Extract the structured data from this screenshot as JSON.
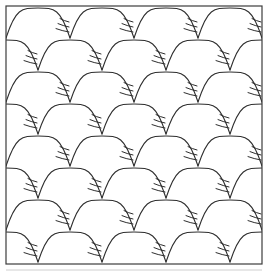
{
  "figure": {
    "title": "Clamshell quilting pattern swatch",
    "type": "ornamental-pattern",
    "background_color": "#ffffff",
    "canvas": {
      "width": 268,
      "height": 273
    }
  },
  "frame": {
    "name": "square-border",
    "x": 6,
    "y": 6,
    "width": 256,
    "height": 258,
    "stroke_color": "#3c3c3c",
    "stroke_width": 1.2,
    "fill": "none"
  },
  "baseline": {
    "name": "faint-lower-rule",
    "x1": 6,
    "x2": 262,
    "y": 270,
    "stroke_color": "#cfcfcf",
    "stroke_width": 1
  },
  "pattern": {
    "name": "clamshell-scale-tessellation",
    "motif": "scallop-arc-with-feather-ticks",
    "arc_stroke_color": "#2e2e2e",
    "arc_stroke_width": 1.1,
    "feather_stroke_color": "#2e2e2e",
    "feather_stroke_width": 1.0,
    "columns_per_row": 4,
    "rows": 8,
    "column_period": 64,
    "row_spacing": 32,
    "arc_radius": 32,
    "arc_rise": 30,
    "offset_rows_shift": 32,
    "row_offsets": [
      0,
      32,
      0,
      32,
      0,
      32,
      0,
      32
    ],
    "row_baseline_y": [
      38,
      70,
      102,
      134,
      166,
      198,
      230,
      262
    ],
    "feather_ticks_per_cusp": 3,
    "feather_tick_lengths": [
      13,
      11,
      9
    ],
    "feather_tick_spacing": 5,
    "feather_side": "left-of-cusp",
    "clip_to_frame": true
  },
  "chart_data": {
    "type": "pattern",
    "title": "Clamshell quilting pattern swatch",
    "xlabel": "",
    "ylabel": "",
    "categories": [
      "row 1",
      "row 2",
      "row 3",
      "row 4",
      "row 5",
      "row 6",
      "row 7",
      "row 8"
    ],
    "values": [
      4,
      4,
      4,
      4,
      4,
      4,
      4,
      4
    ],
    "series": [
      {
        "name": "arcs per row",
        "values": [
          4,
          4,
          4,
          4,
          4,
          4,
          4,
          4
        ]
      },
      {
        "name": "row x-offset (px)",
        "values": [
          0,
          32,
          0,
          32,
          0,
          32,
          0,
          32
        ]
      },
      {
        "name": "baseline y (px)",
        "values": [
          38,
          70,
          102,
          134,
          166,
          198,
          230,
          262
        ]
      }
    ],
    "legend": [],
    "grid": false
  }
}
